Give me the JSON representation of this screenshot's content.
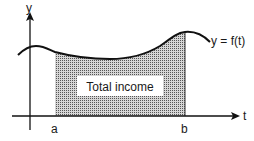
{
  "diagram": {
    "type": "area-under-curve",
    "y_axis_label": "y",
    "x_axis_label": "t",
    "curve_label": "y = f(t)",
    "lower_bound_label": "a",
    "upper_bound_label": "b",
    "area_label": "Total income",
    "colors": {
      "stroke": "#111111",
      "area_fill": "#9a9a9a",
      "label_box": "#ffffff"
    }
  }
}
